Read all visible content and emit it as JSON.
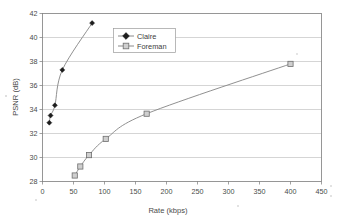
{
  "chart_data": {
    "type": "line",
    "title": "",
    "xlabel": "Rate (kbps)",
    "ylabel": "PSNR (dB)",
    "xlim": [
      0,
      450
    ],
    "ylim": [
      28,
      42
    ],
    "xticks": [
      0,
      50,
      100,
      150,
      200,
      250,
      300,
      350,
      400,
      450
    ],
    "yticks": [
      28,
      30,
      32,
      34,
      36,
      38,
      40,
      42
    ],
    "grid": "horizontal",
    "legend_position": "top-left-inside",
    "series": [
      {
        "name": "Claire",
        "marker": "filled-diamond",
        "color": "#1d1d1d",
        "x": [
          11,
          13,
          20,
          32,
          80
        ],
        "y": [
          32.9,
          33.5,
          34.35,
          37.3,
          41.2
        ]
      },
      {
        "name": "Foreman",
        "marker": "open-square",
        "color": "#8a8a8a",
        "x": [
          52,
          61,
          75,
          102,
          168,
          400
        ],
        "y": [
          28.5,
          29.25,
          30.2,
          31.55,
          33.65,
          37.8
        ]
      }
    ]
  },
  "axis": {
    "x_tick_labels": [
      "0",
      "50",
      "100",
      "150",
      "200",
      "250",
      "300",
      "350",
      "400",
      "450"
    ],
    "y_tick_labels": [
      "28",
      "30",
      "32",
      "34",
      "36",
      "38",
      "40",
      "42"
    ],
    "x_title": "Rate (kbps)",
    "y_title": "PSNR (dB)"
  },
  "legend": {
    "items": [
      {
        "label": "Claire",
        "marker": "filled-diamond"
      },
      {
        "label": "Foreman",
        "marker": "open-square"
      }
    ]
  }
}
